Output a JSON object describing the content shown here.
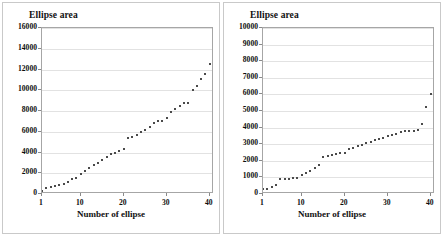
{
  "figure": {
    "panel_count": 2,
    "background": "#ffffff",
    "border_color": "#c9c9c9"
  },
  "chart_data": [
    {
      "type": "scatter",
      "panel": "left",
      "title": "Ellipse area",
      "xlabel": "Number of ellipse",
      "ylabel": "Ellipse area",
      "xlim": [
        1,
        41
      ],
      "ylim": [
        0,
        16000
      ],
      "xticks": [
        1,
        10,
        20,
        30,
        40
      ],
      "yticks": [
        0,
        2000,
        4000,
        6000,
        8000,
        10000,
        12000,
        14000,
        16000
      ],
      "ytick_labels": [
        "0",
        "2000",
        "4000",
        "6000",
        "8000",
        "10000",
        "12000",
        "14000",
        "16000"
      ],
      "xtick_labels": [
        "1",
        "10",
        "20",
        "30",
        "40"
      ],
      "grid": "horizontal",
      "legend": "none",
      "marker": "small-square",
      "marker_color": "#4a4a4a",
      "x": [
        1,
        2,
        3,
        4,
        5,
        6,
        7,
        8,
        9,
        10,
        11,
        12,
        13,
        14,
        15,
        16,
        17,
        18,
        19,
        20,
        21,
        22,
        23,
        24,
        25,
        26,
        27,
        28,
        29,
        30,
        31,
        32,
        33,
        34,
        35,
        36,
        37,
        38,
        39,
        40
      ],
      "values": [
        330,
        620,
        700,
        760,
        900,
        980,
        1200,
        1450,
        1500,
        1900,
        2250,
        2500,
        2750,
        3000,
        3250,
        3550,
        3900,
        4000,
        4150,
        4350,
        5350,
        5450,
        5700,
        6000,
        6200,
        6450,
        6800,
        7050,
        7050,
        7350,
        7900,
        8150,
        8500,
        8800,
        8800,
        10050,
        10450,
        11050,
        11600,
        12550,
        13200
      ]
    },
    {
      "type": "scatter",
      "panel": "right",
      "title": "Ellipse area",
      "xlabel": "Number of ellipse",
      "ylabel": "Ellipse area",
      "xlim": [
        1,
        41
      ],
      "ylim": [
        0,
        10000
      ],
      "xticks": [
        1,
        10,
        20,
        30,
        40
      ],
      "yticks": [
        0,
        1000,
        2000,
        3000,
        4000,
        5000,
        6000,
        7000,
        8000,
        9000,
        10000
      ],
      "ytick_labels": [
        "0",
        "1000",
        "2000",
        "3000",
        "4000",
        "5000",
        "6000",
        "7000",
        "8000",
        "9000",
        "10000"
      ],
      "xtick_labels": [
        "1",
        "10",
        "20",
        "30",
        "40"
      ],
      "grid": "horizontal",
      "legend": "none",
      "marker": "small-square",
      "marker_color": "#4a4a4a",
      "x": [
        1,
        2,
        3,
        4,
        5,
        6,
        7,
        8,
        9,
        10,
        11,
        12,
        13,
        14,
        15,
        16,
        17,
        18,
        19,
        20,
        21,
        22,
        23,
        24,
        25,
        26,
        27,
        28,
        29,
        30,
        31,
        32,
        33,
        34,
        35,
        36,
        37,
        38,
        39,
        40
      ],
      "values": [
        280,
        320,
        420,
        560,
        880,
        900,
        920,
        950,
        960,
        1150,
        1250,
        1400,
        1550,
        1750,
        2200,
        2280,
        2320,
        2400,
        2450,
        2500,
        2700,
        2800,
        2900,
        2980,
        3050,
        3150,
        3250,
        3300,
        3400,
        3480,
        3550,
        3600,
        3750,
        3800,
        3800,
        3820,
        3850,
        4200,
        5250,
        6050
      ]
    }
  ]
}
